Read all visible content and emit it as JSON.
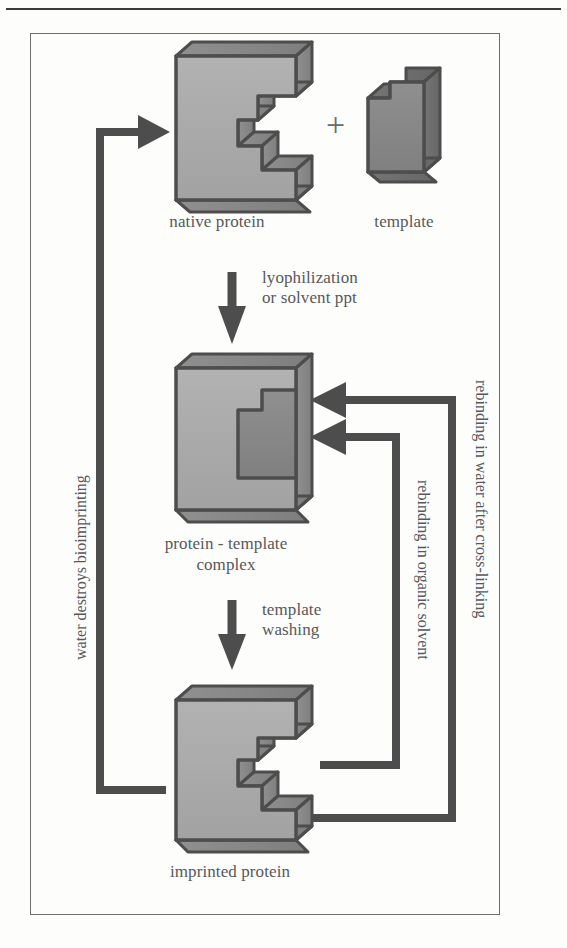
{
  "figure": {
    "kind": "process-flow-diagram",
    "frame": {
      "border_color": "#6d6d6d"
    },
    "palette": {
      "protein_face": "#a9a9a9",
      "protein_side": "#8a8a8a",
      "protein_outline": "#4d4d4d",
      "template_face": "#8c8c8c",
      "template_side": "#6f6f6f",
      "arrow": "#4d4d4d",
      "text": "#58585a",
      "background": "#fdfdfc"
    }
  },
  "shapes": {
    "native_protein": {
      "label": "native protein",
      "style": "E-shaped 3D block, light gray"
    },
    "template": {
      "label": "template",
      "style": "notched 3D block, dark gray"
    },
    "complex": {
      "label_line1": "protein - template",
      "label_line2": "complex",
      "style": "filled block with dark template inset"
    },
    "imprinted_protein": {
      "label": "imprinted protein",
      "style": "E-shaped 3D block with cavity, light gray"
    }
  },
  "operators": {
    "plus": "+"
  },
  "arrows": {
    "combine": {
      "name": "combine-arrow",
      "direction": "right",
      "label": ""
    },
    "lyophilization": {
      "name": "lyophilization-arrow",
      "direction": "down",
      "label": "lyophilization\nor solvent ppt"
    },
    "template_washing": {
      "name": "template-washing-arrow",
      "direction": "down",
      "label": "template\nwashing"
    },
    "water_destroys": {
      "name": "water-destroys-arrow",
      "direction": "up-then-right",
      "label": "water destroys bioimprinting"
    },
    "rebinding_water": {
      "name": "rebinding-water-arrow",
      "direction": "up-then-left",
      "label": "rebinding in water after cross-linking"
    },
    "rebinding_organic": {
      "name": "rebinding-organic-arrow",
      "direction": "up-then-left",
      "label": "rebinding in organic solvent"
    }
  }
}
